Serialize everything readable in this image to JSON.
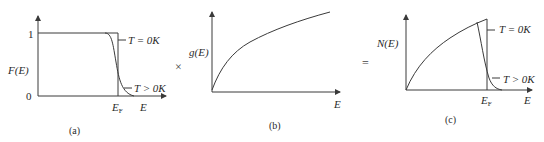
{
  "figure": {
    "operators": {
      "times": "×",
      "equals": "="
    },
    "panels": [
      {
        "id": "a",
        "caption": "(a)",
        "y_label": "F(E)",
        "x_label": "E",
        "fermi_label": "E",
        "fermi_sub": "F",
        "y_tick_top": "1",
        "y_tick_zero": "0",
        "curve_labels": {
          "t0": "T = 0K",
          "tpos": "T > 0K"
        }
      },
      {
        "id": "b",
        "caption": "(b)",
        "y_label": "g(E)",
        "x_label": "E"
      },
      {
        "id": "c",
        "caption": "(c)",
        "y_label": "N(E)",
        "x_label": "E",
        "fermi_label": "E",
        "fermi_sub": "F",
        "curve_labels": {
          "t0": "T = 0K",
          "tpos": "T > 0K"
        }
      }
    ]
  },
  "colors": {
    "line": "#3a3a3a",
    "text": "#2a2a2a",
    "background": "#ffffff"
  }
}
